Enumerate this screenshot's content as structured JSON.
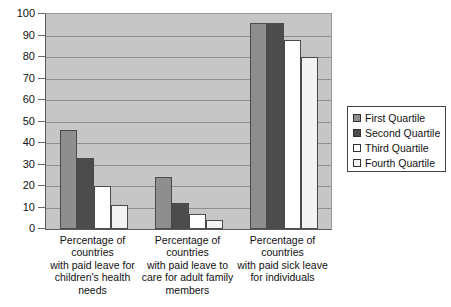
{
  "chart_data": {
    "type": "bar",
    "title": "",
    "subtitle": "",
    "xlabel": "",
    "ylabel": "",
    "ylim": [
      0,
      100
    ],
    "yticks": [
      0,
      10,
      20,
      30,
      40,
      50,
      60,
      70,
      80,
      90,
      100
    ],
    "ytick_labels": [
      "0",
      "10",
      "20",
      "30",
      "40",
      "50",
      "60",
      "70",
      "80",
      "90",
      "100"
    ],
    "grid": true,
    "legend_position": "right",
    "categories": [
      "Percentage of countries with paid leave for children's health needs",
      "Percentage of countries with paid leave to care for adult family members",
      "Percentage of countries with paid sick leave for individuals"
    ],
    "category_lines": [
      [
        "Percentage of",
        "countries",
        "with paid leave for",
        "children's health",
        "needs"
      ],
      [
        "Percentage of",
        "countries",
        "with paid leave to",
        "care for adult family",
        "members"
      ],
      [
        "Percentage of",
        "countries",
        "with paid sick leave",
        "for individuals"
      ]
    ],
    "series": [
      {
        "name": "First Quartile",
        "color": "#8e8e8e",
        "values": [
          46,
          24,
          96
        ]
      },
      {
        "name": "Second Quartile",
        "color": "#4c4c4c",
        "values": [
          33,
          12,
          96
        ]
      },
      {
        "name": "Third Quartile",
        "color": "#ffffff",
        "values": [
          20,
          7,
          88
        ]
      },
      {
        "name": "Fourth Quartile",
        "color": "#f3f3f3",
        "values": [
          11,
          4,
          80
        ]
      }
    ]
  },
  "legend": {
    "items": [
      {
        "label": "First Quartile"
      },
      {
        "label": "Second Quartile"
      },
      {
        "label": "Third Quartile"
      },
      {
        "label": "Fourth Quartile"
      }
    ]
  }
}
